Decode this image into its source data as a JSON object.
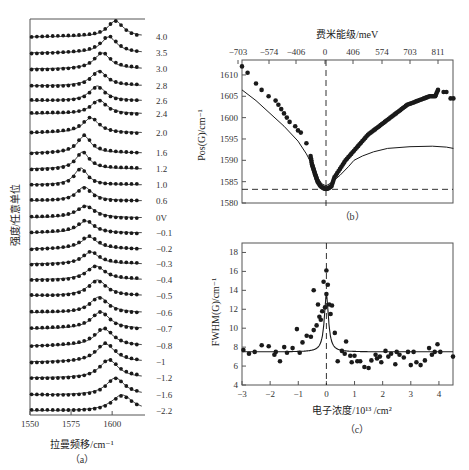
{
  "colors": {
    "ink": "#1a1a1a",
    "axis": "#555555",
    "background": "#ffffff"
  },
  "chart_data": [
    {
      "id": "a",
      "type": "line",
      "title": "",
      "caption": "（a）",
      "xlabel": "拉曼频移/cm⁻¹",
      "ylabel": "强度/任意单位",
      "xlim": [
        1550,
        1620
      ],
      "xticks": [
        1550,
        1575,
        1600
      ],
      "series_labels": [
        "4.0",
        "3.5",
        "3.0",
        "2.8",
        "2.6",
        "2.4",
        "2.0",
        "1.6",
        "1.2",
        "1.0",
        "0.6",
        "0V",
        "−0.1",
        "−0.2",
        "−0.3",
        "−0.4",
        "−0.5",
        "−0.6",
        "−0.7",
        "−0.8",
        "−1",
        "−1.2",
        "−1.6",
        "−2.2"
      ],
      "label_y": [
        37,
        53,
        69,
        86,
        101,
        114,
        133,
        153,
        169,
        185,
        201,
        218,
        233,
        249,
        264,
        280,
        296,
        313,
        329,
        346,
        362,
        378,
        395,
        411
      ],
      "peak_positions_cm": [
        1582,
        1588,
        1591,
        1593,
        1595,
        1596,
        1598,
        1599,
        1600,
        1601,
        1602,
        1603,
        1604,
        1605,
        1606,
        1608
      ],
      "series_peak_cm": [
        1602,
        1598,
        1594,
        1592,
        1591,
        1592,
        1587,
        1583,
        1582,
        1581,
        1583,
        1584,
        1584,
        1586,
        1587,
        1590,
        1591,
        1592,
        1593,
        1595,
        1596,
        1598,
        1602,
        1606
      ],
      "series_width_cm": [
        6,
        6,
        6,
        6,
        6,
        6,
        6,
        5,
        5,
        5,
        6,
        7,
        6,
        6,
        6,
        7,
        7,
        7,
        7,
        7,
        7,
        7,
        7,
        8
      ],
      "series_amplitude_px": [
        16,
        16,
        16,
        15,
        15,
        14,
        15,
        17,
        17,
        17,
        14,
        12,
        12,
        12,
        12,
        14,
        16,
        16,
        17,
        17,
        18,
        18,
        17,
        16
      ]
    },
    {
      "id": "b",
      "type": "scatter",
      "caption": "（b）",
      "title_top": "费米能级/meV",
      "ylabel": "Pos(G)/cm⁻¹",
      "ylim": [
        1580,
        1613.5
      ],
      "yticks": [
        1580,
        1585,
        1590,
        1595,
        1600,
        1605,
        1610
      ],
      "top_xtick_labels": [
        "−703",
        "−574",
        "−406",
        "0",
        "406",
        "574",
        "703",
        "811"
      ],
      "top_xtick_px": [
        238,
        269,
        296,
        325,
        353,
        382,
        410,
        438
      ],
      "reference_hline": 1583.2,
      "reference_vline_label": "0",
      "scatter_points_pos_cm": [
        [
          -3.0,
          1612
        ],
        [
          -2.8,
          1610.5
        ],
        [
          -2.5,
          1608
        ],
        [
          -2.3,
          1606.5
        ],
        [
          -2.05,
          1605
        ],
        [
          -1.8,
          1604
        ],
        [
          -1.7,
          1603
        ],
        [
          -1.6,
          1602
        ],
        [
          -1.5,
          1601
        ],
        [
          -1.4,
          1600
        ],
        [
          -1.3,
          1599
        ],
        [
          -1.1,
          1598
        ],
        [
          -1.0,
          1597
        ],
        [
          -0.9,
          1596.5
        ],
        [
          -0.7,
          1594
        ],
        [
          -0.55,
          1591
        ],
        [
          -0.5,
          1589
        ],
        [
          -0.45,
          1588
        ],
        [
          -0.4,
          1587
        ],
        [
          -0.35,
          1586
        ],
        [
          -0.3,
          1585
        ],
        [
          -0.2,
          1584
        ],
        [
          -0.1,
          1583.5
        ],
        [
          0.0,
          1583.3
        ],
        [
          0.1,
          1583.5
        ],
        [
          0.2,
          1584
        ],
        [
          0.3,
          1586
        ],
        [
          0.5,
          1588
        ],
        [
          0.7,
          1590
        ],
        [
          0.9,
          1591.5
        ],
        [
          1.1,
          1593
        ],
        [
          1.3,
          1594.5
        ],
        [
          1.5,
          1596
        ],
        [
          1.7,
          1597
        ],
        [
          1.9,
          1598
        ],
        [
          2.1,
          1599
        ],
        [
          2.3,
          1600
        ],
        [
          2.5,
          1601
        ],
        [
          2.7,
          1602
        ],
        [
          2.9,
          1603
        ],
        [
          3.1,
          1603.5
        ],
        [
          3.3,
          1604
        ],
        [
          3.5,
          1604.5
        ],
        [
          3.7,
          1605
        ],
        [
          3.9,
          1605
        ],
        [
          4.0,
          1606.5
        ],
        [
          4.2,
          1606
        ],
        [
          4.3,
          1606
        ],
        [
          4.45,
          1604.5
        ],
        [
          4.55,
          1604.5
        ]
      ],
      "theory_curve": [
        [
          -3.0,
          1606.5
        ],
        [
          -2.5,
          1604
        ],
        [
          -2.0,
          1601
        ],
        [
          -1.5,
          1598
        ],
        [
          -1.0,
          1594.5
        ],
        [
          -0.7,
          1591.5
        ],
        [
          -0.5,
          1589
        ],
        [
          -0.3,
          1586
        ],
        [
          -0.15,
          1584.5
        ],
        [
          0,
          1584
        ],
        [
          0.2,
          1584.8
        ],
        [
          0.5,
          1586.5
        ],
        [
          0.8,
          1588.5
        ],
        [
          1.0,
          1590
        ],
        [
          1.3,
          1591
        ],
        [
          1.7,
          1592
        ],
        [
          2.2,
          1592.8
        ],
        [
          3.0,
          1593.2
        ],
        [
          3.8,
          1593.3
        ],
        [
          4.3,
          1593.1
        ],
        [
          4.55,
          1592.8
        ]
      ]
    },
    {
      "id": "c",
      "type": "scatter",
      "caption": "（c）",
      "xlabel": "电子浓度/10¹³ /cm²",
      "ylabel": "FWHM(G)/cm⁻¹",
      "xlim": [
        -3,
        4.5
      ],
      "ylim": [
        4,
        19
      ],
      "xticks": [
        -3,
        -2,
        -1,
        0,
        1,
        2,
        3,
        4
      ],
      "xtick_labels": [
        "−3",
        "−2",
        "−1",
        "0",
        "1",
        "2",
        "3",
        "4"
      ],
      "yticks": [
        4,
        6,
        8,
        10,
        12,
        14,
        16,
        18
      ],
      "baseline_fwhm": 7.5,
      "scatter_points": [
        [
          -2.95,
          7.7
        ],
        [
          -2.75,
          7.3
        ],
        [
          -2.55,
          7.5
        ],
        [
          -2.3,
          8.2
        ],
        [
          -2.05,
          8.1
        ],
        [
          -1.85,
          7.2
        ],
        [
          -1.8,
          7.5
        ],
        [
          -1.65,
          6.5
        ],
        [
          -1.5,
          8.0
        ],
        [
          -1.4,
          7.4
        ],
        [
          -1.2,
          7.9
        ],
        [
          -1.05,
          9.9
        ],
        [
          -0.95,
          7.4
        ],
        [
          -0.85,
          8.5
        ],
        [
          -0.7,
          9.2
        ],
        [
          -0.55,
          9.1
        ],
        [
          -0.45,
          14.0
        ],
        [
          -0.45,
          9.8
        ],
        [
          -0.35,
          10.3
        ],
        [
          -0.3,
          12.5
        ],
        [
          -0.25,
          11.2
        ],
        [
          -0.2,
          10.9
        ],
        [
          -0.15,
          11.8
        ],
        [
          -0.1,
          14.9
        ],
        [
          -0.05,
          12.2
        ],
        [
          0.0,
          16.1
        ],
        [
          0.0,
          13.6
        ],
        [
          0.05,
          14.6
        ],
        [
          0.1,
          12.5
        ],
        [
          0.15,
          11.5
        ],
        [
          0.2,
          12.4
        ],
        [
          0.3,
          9.5
        ],
        [
          0.4,
          6.5
        ],
        [
          0.55,
          7.6
        ],
        [
          0.65,
          7.3
        ],
        [
          0.7,
          8.6
        ],
        [
          0.85,
          7.1
        ],
        [
          0.9,
          6.4
        ],
        [
          1.0,
          7.1
        ],
        [
          1.1,
          6.5
        ],
        [
          1.2,
          6.5
        ],
        [
          1.35,
          5.9
        ],
        [
          1.5,
          5.8
        ],
        [
          1.6,
          6.6
        ],
        [
          1.75,
          7.2
        ],
        [
          1.8,
          6.8
        ],
        [
          1.9,
          7.0
        ],
        [
          1.95,
          6.4
        ],
        [
          2.1,
          7.6
        ],
        [
          2.2,
          7.0
        ],
        [
          2.3,
          7.3
        ],
        [
          2.45,
          6.2
        ],
        [
          2.5,
          7.5
        ],
        [
          2.6,
          7.2
        ],
        [
          2.75,
          6.9
        ],
        [
          2.9,
          7.5
        ],
        [
          3.0,
          6.1
        ],
        [
          3.1,
          7.5
        ],
        [
          3.2,
          6.4
        ],
        [
          3.35,
          6.1
        ],
        [
          3.5,
          6.6
        ],
        [
          3.65,
          7.9
        ],
        [
          3.75,
          7.2
        ],
        [
          3.85,
          7.5
        ],
        [
          3.95,
          8.3
        ],
        [
          4.05,
          7.5
        ],
        [
          4.5,
          7.0
        ]
      ],
      "theory_peak": {
        "center": 0.0,
        "height": 13.5,
        "half_width": 0.09
      }
    }
  ]
}
